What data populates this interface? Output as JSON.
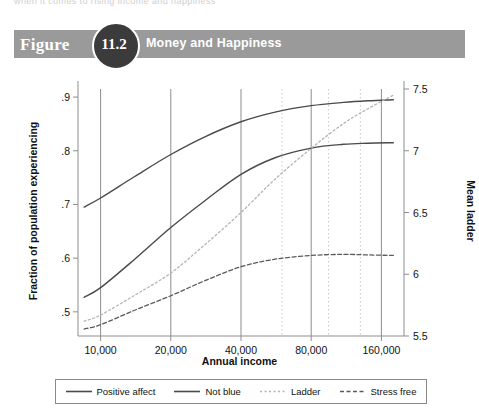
{
  "running_text": "when it comes to rising income and happiness",
  "title": {
    "figure_word": "Figure",
    "number": "11.2",
    "caption": "Money and Happiness",
    "banner_color": "#9a9a9a",
    "circle_color": "#3b3b3b"
  },
  "chart_data": {
    "type": "line",
    "title": "Money and Happiness",
    "xlabel": "Annual income",
    "ylabel": "Fraction of population experiencing",
    "ylabel_right": "Mean ladder",
    "xscale": "log",
    "xlim": [
      8000,
      200000
    ],
    "ylim": [
      0.455,
      0.915
    ],
    "ylim_right": [
      5.5,
      7.5
    ],
    "xticks": [
      10000,
      20000,
      40000,
      80000,
      160000
    ],
    "xticklabels": [
      "10,000",
      "20,000",
      "40,000",
      "80,000",
      "160,000"
    ],
    "yticks_left": [
      0.5,
      0.6,
      0.7,
      0.8,
      0.9
    ],
    "yticklabels_left": [
      ".5",
      ".6",
      ".7",
      ".8",
      ".9"
    ],
    "yticks_right": [
      5.5,
      6,
      6.5,
      7,
      7.5
    ],
    "yticklabels_right": [
      "5.5",
      "6",
      "6.5",
      "7",
      "7.5"
    ],
    "grid": "vertical",
    "gridlines_solid": [
      10000,
      20000,
      40000,
      80000,
      160000
    ],
    "gridlines_dotted": [
      60000,
      95000,
      130000
    ],
    "legend_position": "bottom",
    "series": [
      {
        "name": "Positive affect",
        "axis": "left",
        "style": "solid",
        "color": "#4a4a4a",
        "x": [
          8500,
          10000,
          14000,
          20000,
          28000,
          40000,
          56000,
          80000,
          110000,
          140000,
          180000
        ],
        "values": [
          0.695,
          0.712,
          0.752,
          0.793,
          0.826,
          0.854,
          0.872,
          0.884,
          0.89,
          0.893,
          0.895
        ]
      },
      {
        "name": "Not blue",
        "axis": "left",
        "style": "solid",
        "color": "#4a4a4a",
        "x": [
          8500,
          10000,
          14000,
          20000,
          28000,
          40000,
          56000,
          80000,
          110000,
          140000,
          180000
        ],
        "values": [
          0.527,
          0.545,
          0.598,
          0.657,
          0.707,
          0.756,
          0.787,
          0.805,
          0.812,
          0.814,
          0.815
        ]
      },
      {
        "name": "Ladder",
        "axis": "right",
        "style": "dotted-light",
        "color": "#b4b4b4",
        "x": [
          8500,
          10000,
          14000,
          20000,
          28000,
          40000,
          56000,
          80000,
          110000,
          140000,
          180000
        ],
        "values": [
          5.62,
          5.67,
          5.83,
          6.01,
          6.24,
          6.5,
          6.77,
          7.02,
          7.22,
          7.34,
          7.45
        ]
      },
      {
        "name": "Stress free",
        "axis": "left",
        "style": "dashed-dark",
        "color": "#5a5a5a",
        "x": [
          8500,
          10000,
          14000,
          20000,
          28000,
          40000,
          56000,
          80000,
          110000,
          140000,
          180000
        ],
        "values": [
          0.468,
          0.476,
          0.503,
          0.53,
          0.558,
          0.584,
          0.598,
          0.605,
          0.607,
          0.606,
          0.605
        ]
      }
    ]
  },
  "legend": [
    {
      "label": "Positive affect",
      "style": "solid",
      "color": "#4a4a4a"
    },
    {
      "label": "Not blue",
      "style": "solid",
      "color": "#4a4a4a"
    },
    {
      "label": "Ladder",
      "style": "dotted-light",
      "color": "#b4b4b4"
    },
    {
      "label": "Stress free",
      "style": "dashed-dark",
      "color": "#5a5a5a"
    }
  ]
}
